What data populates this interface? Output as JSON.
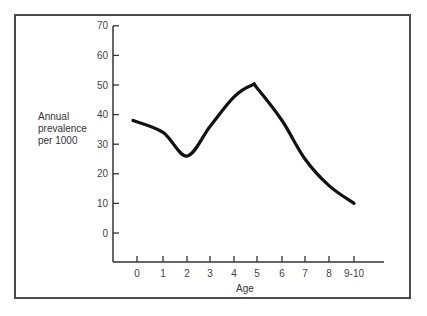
{
  "chart_data": {
    "type": "line",
    "title": "",
    "xlabel": "Age",
    "ylabel": "Annual prevalence per 1000",
    "categories": [
      "0",
      "1",
      "2",
      "3",
      "4",
      "5",
      "6",
      "7",
      "8",
      "9-10"
    ],
    "series": [
      {
        "name": "Annual prevalence per 1000",
        "values": [
          38,
          34,
          26,
          36,
          46,
          49,
          38,
          25,
          16,
          10
        ]
      }
    ],
    "peak": {
      "x": 4.8,
      "y": 50
    },
    "yticks": [
      0,
      10,
      20,
      30,
      40,
      50,
      60,
      70
    ],
    "ylim": [
      -10,
      70
    ],
    "grid": false,
    "legend": "none"
  },
  "labels": {
    "ylabel_lines": "Annual\nprevalence\nper 1000",
    "xlabel": "Age"
  },
  "colors": {
    "line": "#111111",
    "axis": "#333333",
    "frame": "#4a4a4a"
  }
}
